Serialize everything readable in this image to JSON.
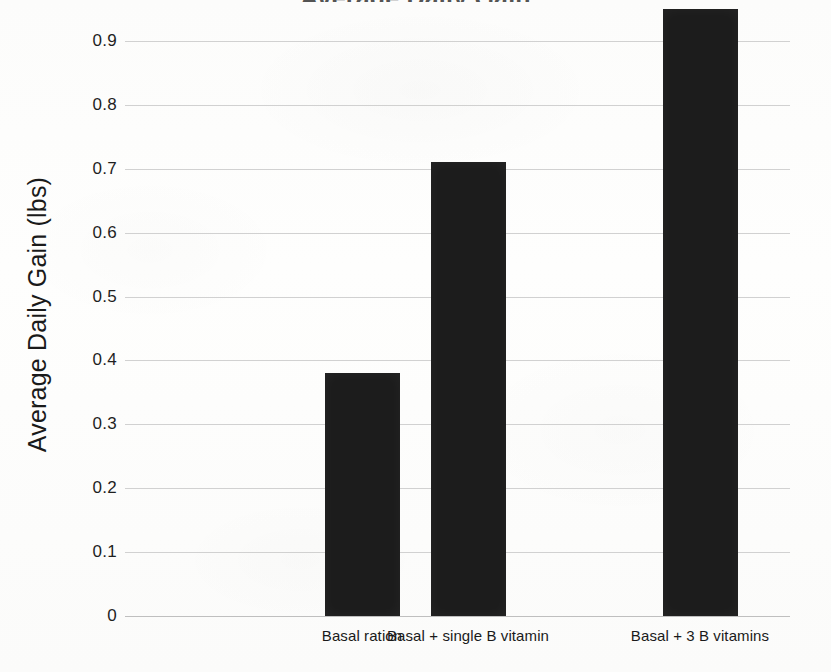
{
  "chart_data": {
    "type": "bar",
    "title": "Average Daily Gain",
    "title_note": "top of title is cropped off the top edge of the image",
    "xlabel": "",
    "ylabel": "Average Daily Gain (lbs)",
    "categories": [
      "Basal ration",
      "Basal + single B vitamin",
      "Basal + 3 B vitamins"
    ],
    "values": [
      0.38,
      0.71,
      0.95
    ],
    "ylim": [
      0,
      0.95
    ],
    "ytick_labels": [
      "0.9",
      "0.8",
      "0.7",
      "0.6",
      "0.5",
      "0.4",
      "0.3",
      "0.2",
      "0.1",
      "0"
    ],
    "ytick_values": [
      0.9,
      0.8,
      0.7,
      0.6,
      0.5,
      0.4,
      0.3,
      0.2,
      0.1,
      0
    ],
    "grid": true,
    "grid_axis": "y",
    "legend": "none",
    "bar_color": "#1c1c1c",
    "grid_color": "#c9c9c9",
    "background_color": "#fdfdfc",
    "text_color": "#1a1a1a"
  },
  "axes": {
    "y_title": "Average Daily Gain (lbs)"
  }
}
